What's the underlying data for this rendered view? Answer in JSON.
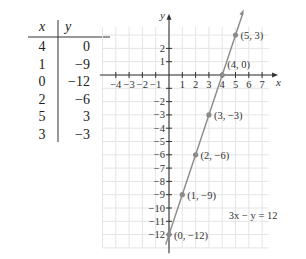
{
  "table": {
    "headers": {
      "x": "x",
      "y": "y"
    },
    "rows": [
      {
        "x": "4",
        "y": "0"
      },
      {
        "x": "1",
        "y": "−9"
      },
      {
        "x": "0",
        "y": "−12"
      },
      {
        "x": "2",
        "y": "−6"
      },
      {
        "x": "5",
        "y": "3"
      },
      {
        "x": "3",
        "y": "−3"
      }
    ]
  },
  "chart_data": {
    "type": "line",
    "title": "",
    "xlabel": "x",
    "ylabel": "y",
    "xlim": [
      -5,
      8
    ],
    "ylim": [
      -13,
      4
    ],
    "grid": true,
    "x_ticks": [
      -4,
      -3,
      -2,
      -1,
      1,
      2,
      3,
      4,
      5,
      6,
      7
    ],
    "x_tick_labels": [
      "−4",
      "−3",
      "−2",
      "−1",
      "1",
      "2",
      "3",
      "4",
      "5",
      "6",
      "7"
    ],
    "y_ticks": [
      2,
      1,
      -1,
      -2,
      -3,
      -4,
      -5,
      -6,
      -7,
      -8,
      -9,
      -10,
      -11,
      -12
    ],
    "y_tick_labels": [
      "2",
      "1",
      "",
      "−2",
      "−3",
      "−4",
      "−5",
      "−6",
      "−7",
      "−8",
      "−9",
      "−10",
      "−11",
      "−12"
    ],
    "series": [
      {
        "name": "3x − y = 12",
        "equation": "3x − y = 12",
        "slope": 3,
        "intercept": -12,
        "points": [
          {
            "x": 5,
            "y": 3,
            "label": "(5, 3)"
          },
          {
            "x": 4,
            "y": 0,
            "label": "(4, 0)"
          },
          {
            "x": 3,
            "y": -3,
            "label": "(3, −3)"
          },
          {
            "x": 2,
            "y": -6,
            "label": "(2, −6)"
          },
          {
            "x": 1,
            "y": -9,
            "label": "(1, −9)"
          },
          {
            "x": 0,
            "y": -12,
            "label": "(0, −12)"
          }
        ]
      }
    ],
    "annotations": [
      {
        "text": "3x − y = 12",
        "x": 4.5,
        "y": -10.5
      }
    ],
    "colors": {
      "line": "#8a8a8a",
      "point": "#8a8a8a",
      "grid": "#e4e4e4",
      "axis": "#333333"
    }
  }
}
